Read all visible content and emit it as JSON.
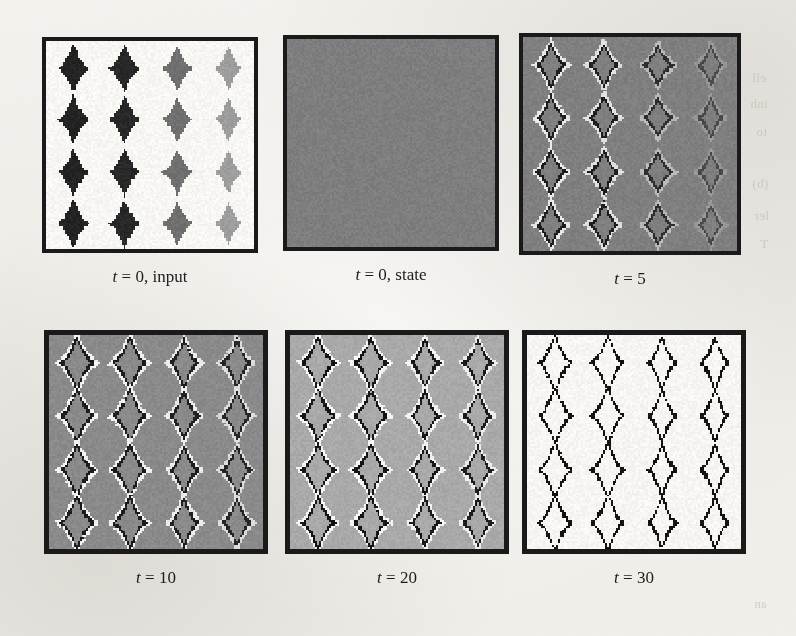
{
  "figure": {
    "kind": "cellular-automaton-evolution-grid",
    "background_color": "#f2f0ec",
    "panel_border_color": "#1a1a1a",
    "rows": 2,
    "columns": 3,
    "grid_pattern": {
      "blob_rows": 4,
      "blob_cols": 4,
      "blob_shape": "pixelated-diamond"
    },
    "panels": [
      {
        "id": "t0-input",
        "caption_var": "t",
        "caption_rest": " = 0, input",
        "caption_full": "t = 0, input",
        "x": 42,
        "y": 37,
        "w": 216,
        "h": 216,
        "background": "#f7f6f3",
        "border_width": 4,
        "style": "filled-blobs",
        "column_colors": [
          "#232323",
          "#282828",
          "#6f6f6f",
          "#9d9d9d"
        ],
        "blob_rx": 14,
        "blob_ry": 20,
        "halo": false,
        "ring": false
      },
      {
        "id": "t0-state",
        "caption_var": "t",
        "caption_rest": " = 0, state",
        "caption_full": "t = 0, state",
        "x": 283,
        "y": 35,
        "w": 216,
        "h": 216,
        "background": "#7e7e7e",
        "border_width": 4,
        "style": "uniform",
        "column_colors": [
          "#7e7e7e",
          "#7e7e7e",
          "#7e7e7e",
          "#7e7e7e"
        ],
        "blob_rx": 0,
        "blob_ry": 0,
        "halo": false,
        "ring": false
      },
      {
        "id": "t5",
        "caption_var": "t",
        "caption_rest": " = 5",
        "caption_full": "t = 5",
        "x": 519,
        "y": 33,
        "w": 222,
        "h": 222,
        "background": "#7f7f7f",
        "border_width": 4,
        "style": "rings",
        "column_colors": [
          "#1e1e1e",
          "#1e1e1e",
          "#2e2e2e",
          "#4a4a4a"
        ],
        "halo_colors": [
          "#e8e8e8",
          "#e0e0e0",
          "#b9b9b9",
          "#989898"
        ],
        "blob_rx": 13,
        "blob_ry": 19,
        "ring_thickness": 3,
        "halo": true,
        "ring": true
      },
      {
        "id": "t10",
        "caption_var": "t",
        "caption_rest": " = 10",
        "caption_full": "t = 10",
        "x": 44,
        "y": 330,
        "w": 224,
        "h": 224,
        "background": "#8a8a8a",
        "border_width": 5,
        "style": "rings",
        "column_colors": [
          "#1c1c1c",
          "#1c1c1c",
          "#202020",
          "#262626"
        ],
        "halo_colors": [
          "#f2f2f2",
          "#f0f0f0",
          "#ebebeb",
          "#dcdcdc"
        ],
        "blob_rx": 16,
        "blob_ry": 23,
        "ring_thickness": 4,
        "halo": true,
        "ring": true
      },
      {
        "id": "t20",
        "caption_var": "t",
        "caption_rest": " = 20",
        "caption_full": "t = 20",
        "x": 285,
        "y": 330,
        "w": 224,
        "h": 224,
        "background": "#a9a9a9",
        "border_width": 5,
        "style": "rings",
        "column_colors": [
          "#161616",
          "#161616",
          "#181818",
          "#1c1c1c"
        ],
        "halo_colors": [
          "#f6f6f6",
          "#f5f5f5",
          "#f2f2f2",
          "#ececec"
        ],
        "blob_rx": 15,
        "blob_ry": 24,
        "ring_thickness": 4,
        "halo": true,
        "ring": true
      },
      {
        "id": "t30",
        "caption_var": "t",
        "caption_rest": " = 30",
        "caption_full": "t = 30",
        "x": 522,
        "y": 330,
        "w": 224,
        "h": 224,
        "background": "#f6f5f2",
        "border_width": 5,
        "style": "outlines",
        "column_colors": [
          "#141414",
          "#141414",
          "#141414",
          "#141414"
        ],
        "halo_colors": [
          "#f6f5f2",
          "#f6f5f2",
          "#f6f5f2",
          "#f6f5f2"
        ],
        "blob_rx": 15,
        "blob_ry": 25,
        "ring_thickness": 3,
        "halo": false,
        "ring": true
      }
    ],
    "caption_offset_y": 224,
    "bleed_through_text": [
      {
        "text": "ell",
        "x": 752,
        "y": 70
      },
      {
        "text": "inh",
        "x": 750,
        "y": 96
      },
      {
        "text": "to",
        "x": 756,
        "y": 124
      },
      {
        "text": "(b)",
        "x": 752,
        "y": 176
      },
      {
        "text": "ler",
        "x": 754,
        "y": 208
      },
      {
        "text": "T",
        "x": 760,
        "y": 236
      },
      {
        "text": "an",
        "x": 754,
        "y": 596
      }
    ]
  }
}
